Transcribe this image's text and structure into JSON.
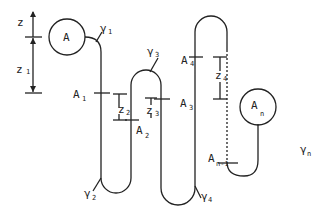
{
  "diagram": {
    "type": "chain-of-beads-folding",
    "nodes": [
      {
        "id": "A",
        "label": "A",
        "shape": "circle"
      },
      {
        "id": "An",
        "label": "A",
        "subscript": "n",
        "shape": "circle"
      }
    ],
    "point_labels": [
      {
        "label": "A",
        "subscript": "1"
      },
      {
        "label": "A",
        "subscript": "2"
      },
      {
        "label": "A",
        "subscript": "3"
      },
      {
        "label": "A",
        "subscript": "4"
      },
      {
        "label": "A",
        "subscript": "n-1"
      }
    ],
    "curve_labels": [
      {
        "label": "γ",
        "subscript": "1"
      },
      {
        "label": "γ",
        "subscript": "2"
      },
      {
        "label": "γ",
        "subscript": "3"
      },
      {
        "label": "γ",
        "subscript": "4"
      },
      {
        "label": "γ",
        "subscript": "n"
      }
    ],
    "dimension_labels": [
      {
        "label": "z",
        "subscript": ""
      },
      {
        "label": "z",
        "subscript": "1"
      },
      {
        "label": "z",
        "subscript": "2"
      },
      {
        "label": "z",
        "subscript": "3"
      },
      {
        "label": "z",
        "subscript": "4"
      }
    ],
    "colors": {
      "stroke": "#222222",
      "background": "#ffffff"
    }
  }
}
